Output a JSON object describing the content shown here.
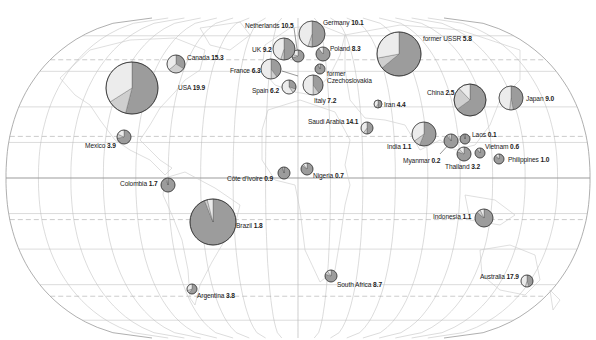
{
  "map": {
    "projection": "pseudo-cylindrical world (Eckert-like)",
    "colors": {
      "background": "#ffffff",
      "graticule": "#b9b9b9",
      "graticule_dashed": "#a8a8a8",
      "coast": "#c9c9c9",
      "pie_dark": "#9c9c9c",
      "pie_mid": "#cfcfcf",
      "pie_light": "#ececec",
      "pie_stroke": "#333333"
    }
  },
  "chart_data": {
    "type": "pie",
    "title": "",
    "countries": [
      {
        "name": "USA",
        "value": "19.9",
        "cx": 132,
        "cy": 88,
        "r": 26,
        "slices": [
          0.54,
          0.12,
          0.34
        ]
      },
      {
        "name": "Canada",
        "value": "15.3",
        "cx": 176,
        "cy": 64,
        "r": 9,
        "slices": [
          0.34,
          0.3,
          0.36
        ]
      },
      {
        "name": "Mexico",
        "value": "3.9",
        "cx": 124,
        "cy": 137,
        "r": 7,
        "slices": [
          0.72,
          0.1,
          0.18
        ]
      },
      {
        "name": "Colombia",
        "value": "1.7",
        "cx": 168,
        "cy": 185,
        "r": 7,
        "slices": [
          0.95,
          0.03,
          0.02
        ]
      },
      {
        "name": "Brazil",
        "value": "1.8",
        "cx": 213,
        "cy": 222,
        "r": 23,
        "slices": [
          0.94,
          0.02,
          0.04
        ]
      },
      {
        "name": "Argentina",
        "value": "3.8",
        "cx": 192,
        "cy": 289,
        "r": 5,
        "slices": [
          0.6,
          0.1,
          0.3
        ]
      },
      {
        "name": "Netherlands",
        "value": "10.5",
        "cx": 298,
        "cy": 56,
        "r": 6,
        "slices": [
          0.7,
          0.1,
          0.2
        ]
      },
      {
        "name": "Germany",
        "value": "10.1",
        "cx": 312,
        "cy": 34,
        "r": 13,
        "slices": [
          0.5,
          0.05,
          0.45
        ]
      },
      {
        "name": "UK",
        "value": "9.2",
        "cx": 284,
        "cy": 49,
        "r": 11,
        "slices": [
          0.5,
          0.05,
          0.45
        ]
      },
      {
        "name": "Poland",
        "value": "8.3",
        "cx": 323,
        "cy": 54,
        "r": 7,
        "slices": [
          0.88,
          0.02,
          0.1
        ]
      },
      {
        "name": "France",
        "value": "6.3",
        "cx": 271,
        "cy": 69,
        "r": 10,
        "slices": [
          0.4,
          0.1,
          0.5
        ]
      },
      {
        "name": "former Czechoslovakia",
        "value": "",
        "cx": 320,
        "cy": 69,
        "r": 5,
        "slices": [
          0.92,
          0.03,
          0.05
        ]
      },
      {
        "name": "Spain",
        "value": "6.2",
        "cx": 289,
        "cy": 87,
        "r": 7,
        "slices": [
          0.3,
          0.1,
          0.6
        ]
      },
      {
        "name": "Italy",
        "value": "7.2",
        "cx": 313,
        "cy": 85,
        "r": 10,
        "slices": [
          0.4,
          0.1,
          0.5
        ]
      },
      {
        "name": "Côte d'Ivoire",
        "value": "0.9",
        "cx": 284,
        "cy": 173,
        "r": 6,
        "slices": [
          0.95,
          0.02,
          0.03
        ]
      },
      {
        "name": "Nigeria",
        "value": "0.7",
        "cx": 307,
        "cy": 169,
        "r": 6,
        "slices": [
          0.85,
          0.05,
          0.1
        ]
      },
      {
        "name": "South Africa",
        "value": "8.7",
        "cx": 331,
        "cy": 276,
        "r": 6,
        "slices": [
          0.8,
          0.1,
          0.1
        ]
      },
      {
        "name": "former USSR",
        "value": "5.8",
        "cx": 399,
        "cy": 54,
        "r": 22,
        "slices": [
          0.64,
          0.08,
          0.28
        ]
      },
      {
        "name": "Iran",
        "value": "4.4",
        "cx": 378,
        "cy": 104,
        "r": 4,
        "slices": [
          0.5,
          0.1,
          0.4
        ]
      },
      {
        "name": "Saudi Arabia",
        "value": "14.1",
        "cx": 367,
        "cy": 128,
        "r": 6,
        "slices": [
          0.5,
          0.1,
          0.4
        ]
      },
      {
        "name": "India",
        "value": "1.1",
        "cx": 424,
        "cy": 134,
        "r": 12,
        "slices": [
          0.56,
          0.09,
          0.35
        ]
      },
      {
        "name": "China",
        "value": "2.5",
        "cx": 470,
        "cy": 100,
        "r": 16,
        "slices": [
          0.65,
          0.23,
          0.12
        ]
      },
      {
        "name": "Japan",
        "value": "9.0",
        "cx": 511,
        "cy": 98,
        "r": 12,
        "slices": [
          0.47,
          0.05,
          0.48
        ]
      },
      {
        "name": "Myanmar",
        "value": "0.2",
        "cx": 451,
        "cy": 141,
        "r": 7,
        "slices": [
          0.9,
          0.05,
          0.05
        ]
      },
      {
        "name": "Laos",
        "value": "0.1",
        "cx": 465,
        "cy": 139,
        "r": 5,
        "slices": [
          0.96,
          0.02,
          0.02
        ]
      },
      {
        "name": "Thailand",
        "value": "3.2",
        "cx": 464,
        "cy": 154,
        "r": 7,
        "slices": [
          0.8,
          0.08,
          0.12
        ]
      },
      {
        "name": "Vietnam",
        "value": "0.6",
        "cx": 480,
        "cy": 153,
        "r": 5,
        "slices": [
          0.88,
          0.04,
          0.08
        ]
      },
      {
        "name": "Philippines",
        "value": "1.0",
        "cx": 499,
        "cy": 159,
        "r": 5,
        "slices": [
          0.85,
          0.05,
          0.1
        ]
      },
      {
        "name": "Indonesia",
        "value": "1.1",
        "cx": 484,
        "cy": 218,
        "r": 9,
        "slices": [
          0.86,
          0.07,
          0.07
        ]
      },
      {
        "name": "Australia",
        "value": "17.9",
        "cx": 527,
        "cy": 281,
        "r": 6,
        "slices": [
          0.45,
          0.1,
          0.45
        ]
      }
    ]
  },
  "labels": [
    {
      "id": "usa",
      "name": "USA",
      "value": "19.9",
      "x": 178,
      "y": 84
    },
    {
      "id": "canada",
      "name": "Canada",
      "value": "15.3",
      "x": 187,
      "y": 54
    },
    {
      "id": "mexico",
      "name": "Mexico",
      "value": "3.9",
      "x": 85,
      "y": 142
    },
    {
      "id": "colombia",
      "name": "Colombia",
      "value": "1.7",
      "x": 120,
      "y": 180
    },
    {
      "id": "brazil",
      "name": "Brazil",
      "value": "1.8",
      "x": 236,
      "y": 222
    },
    {
      "id": "argentina",
      "name": "Argentina",
      "value": "3.8",
      "x": 197,
      "y": 292
    },
    {
      "id": "netherlands",
      "name": "Netherlands",
      "value": "10.5",
      "x": 245,
      "y": 22
    },
    {
      "id": "germany",
      "name": "Germany",
      "value": "10.1",
      "x": 323,
      "y": 19
    },
    {
      "id": "uk",
      "name": "UK",
      "value": "9.2",
      "x": 252,
      "y": 46
    },
    {
      "id": "poland",
      "name": "Poland",
      "value": "8.3",
      "x": 330,
      "y": 45
    },
    {
      "id": "france",
      "name": "France",
      "value": "6.3",
      "x": 230,
      "y": 67
    },
    {
      "id": "czech",
      "name": "former",
      "name2": "Czechoslovakia",
      "value": "",
      "x": 327,
      "y": 70
    },
    {
      "id": "spain",
      "name": "Spain",
      "value": "6.2",
      "x": 252,
      "y": 87
    },
    {
      "id": "italy",
      "name": "Italy",
      "value": "7.2",
      "x": 314,
      "y": 97
    },
    {
      "id": "cote",
      "name": "Côte d'Ivoire",
      "value": "0.9",
      "x": 227,
      "y": 175
    },
    {
      "id": "nigeria",
      "name": "Nigeria",
      "value": "0.7",
      "x": 313,
      "y": 172
    },
    {
      "id": "southafrica",
      "name": "South Africa",
      "value": "8.7",
      "x": 337,
      "y": 281
    },
    {
      "id": "ussr",
      "name": "former USSR",
      "value": "5.8",
      "x": 423,
      "y": 35
    },
    {
      "id": "iran",
      "name": "Iran",
      "value": "4.4",
      "x": 384,
      "y": 101
    },
    {
      "id": "saudi",
      "name": "Saudi Arabia",
      "value": "14.1",
      "x": 308,
      "y": 118
    },
    {
      "id": "india",
      "name": "India",
      "value": "1.1",
      "x": 387,
      "y": 143
    },
    {
      "id": "china",
      "name": "China",
      "value": "2.5",
      "x": 427,
      "y": 89
    },
    {
      "id": "japan",
      "name": "Japan",
      "value": "9.0",
      "x": 526,
      "y": 95
    },
    {
      "id": "myanmar",
      "name": "Myanmar",
      "value": "0.2",
      "x": 403,
      "y": 157
    },
    {
      "id": "laos",
      "name": "Laos",
      "value": "0.1",
      "x": 472,
      "y": 131
    },
    {
      "id": "thailand",
      "name": "Thailand",
      "value": "3.2",
      "x": 445,
      "y": 163
    },
    {
      "id": "vietnam",
      "name": "Vietnam",
      "value": "0.6",
      "x": 485,
      "y": 143
    },
    {
      "id": "philippines",
      "name": "Philippines",
      "value": "1.0",
      "x": 508,
      "y": 156
    },
    {
      "id": "indonesia",
      "name": "Indonesia",
      "value": "1.1",
      "x": 433,
      "y": 213
    },
    {
      "id": "australia",
      "name": "Australia",
      "value": "17.9",
      "x": 480,
      "y": 273
    }
  ]
}
